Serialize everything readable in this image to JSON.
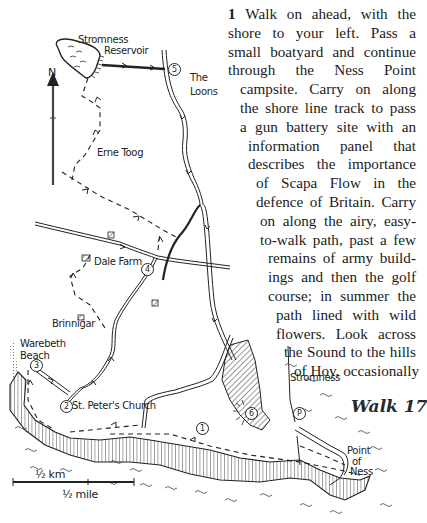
{
  "page": {
    "walk_title": "Walk 17",
    "paragraph": {
      "step_number": "1",
      "lines": [
        {
          "text": "Walk on ahead, with the",
          "justify": true,
          "with_number": true
        },
        {
          "text": "shore to your left. Pass a",
          "justify": true
        },
        {
          "text": "small boatyard and continue",
          "justify": true
        },
        {
          "text": "through the Ness Point",
          "justify": true
        },
        {
          "text": "campsite. Carry on along",
          "justify": true
        },
        {
          "text": "the shore line track to pass",
          "justify": true
        },
        {
          "text": "a gun battery site with an",
          "justify": true
        },
        {
          "text": "information panel that",
          "justify": true
        },
        {
          "text": "describes the importance",
          "justify": true
        },
        {
          "text": "of Scapa Flow in the",
          "justify": true
        },
        {
          "text": "defence of Britain. Carry",
          "justify": true
        },
        {
          "text": "on along the airy, easy-",
          "justify": true
        },
        {
          "text": "to-walk path, past a few",
          "justify": true
        },
        {
          "text": "remains of army build-",
          "justify": true
        },
        {
          "text": "ings and then the golf",
          "justify": true
        },
        {
          "text": "course; in summer the",
          "justify": true
        },
        {
          "text": "path lined with wild",
          "justify": true
        },
        {
          "text": "flowers. Look across",
          "justify": true
        },
        {
          "text": "the Sound to the hills",
          "justify": true
        },
        {
          "text": "of Hoy, occasionally",
          "justify": true
        }
      ]
    }
  },
  "map": {
    "north_label": "N",
    "labels": {
      "reservoir_line1": "Stromness",
      "reservoir_line2": "Reservoir",
      "loons_line1": "The",
      "loons_line2": "Loons",
      "erne_toog": "Erne Toog",
      "dale_farm": "Dale Farm",
      "brinnigar": "Brinnigar",
      "warebeth_line1": "Warebeth",
      "warebeth_line2": "Beach",
      "st_peters": "St. Peter's Church",
      "stromness": "Stromness",
      "point_line1": "Point",
      "point_line2": "of",
      "point_line3": "Ness"
    },
    "markers": {
      "m1": "1",
      "m2": "2",
      "m3": "3",
      "m4": "4",
      "m5": "5",
      "m6": "6",
      "parking": "P"
    },
    "scale": {
      "km_label": "½ km",
      "mile_label": "½ mile"
    },
    "colors": {
      "ink": "#222222",
      "paper": "#ffffff"
    }
  }
}
